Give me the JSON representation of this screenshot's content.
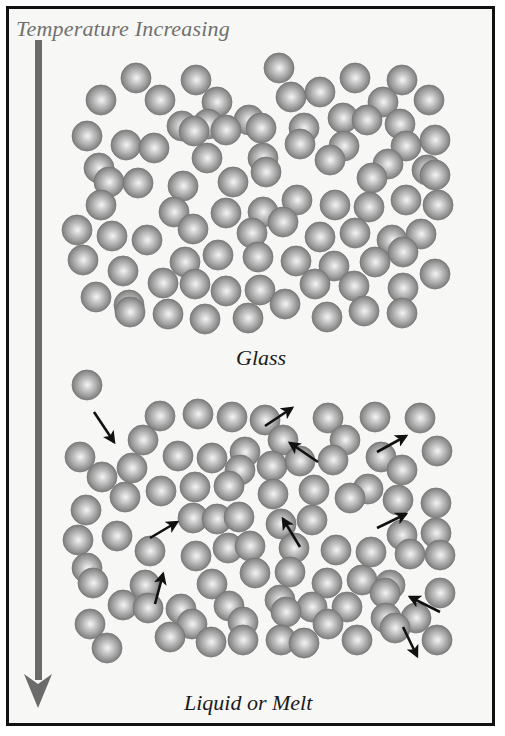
{
  "figure": {
    "title": "Temperature Increasing",
    "glass_label": "Glass",
    "liquid_label": "Liquid or Melt",
    "colors": {
      "background": "#f7f7f5",
      "border": "#111111",
      "title_text": "#707070",
      "label_text": "#1a1a1a",
      "temperature_arrow": "#6b6b6b",
      "sphere_light": "#f2f2f2",
      "sphere_mid": "#a8a8a8",
      "sphere_dark": "#6e6e6e",
      "motion_arrow": "#111111"
    },
    "temperature_arrow": {
      "x": 38,
      "y_start": 40,
      "y_end": 708,
      "direction": "down"
    },
    "sphere_radius": 15,
    "glass_spheres": [
      [
        279,
        68
      ],
      [
        136,
        78
      ],
      [
        196,
        80
      ],
      [
        355,
        78
      ],
      [
        402,
        80
      ],
      [
        101,
        100
      ],
      [
        160,
        100
      ],
      [
        217,
        102
      ],
      [
        291,
        97
      ],
      [
        320,
        92
      ],
      [
        383,
        102
      ],
      [
        429,
        100
      ],
      [
        208,
        124
      ],
      [
        249,
        120
      ],
      [
        182,
        126
      ],
      [
        343,
        118
      ],
      [
        400,
        124
      ],
      [
        87,
        136
      ],
      [
        126,
        145
      ],
      [
        194,
        131
      ],
      [
        226,
        130
      ],
      [
        261,
        128
      ],
      [
        304,
        128
      ],
      [
        367,
        120
      ],
      [
        406,
        146
      ],
      [
        435,
        140
      ],
      [
        99,
        168
      ],
      [
        154,
        148
      ],
      [
        207,
        158
      ],
      [
        263,
        158
      ],
      [
        300,
        144
      ],
      [
        344,
        146
      ],
      [
        388,
        164
      ],
      [
        427,
        170
      ],
      [
        109,
        182
      ],
      [
        138,
        183
      ],
      [
        183,
        186
      ],
      [
        233,
        182
      ],
      [
        266,
        172
      ],
      [
        330,
        160
      ],
      [
        372,
        178
      ],
      [
        435,
        175
      ],
      [
        101,
        205
      ],
      [
        174,
        212
      ],
      [
        226,
        213
      ],
      [
        263,
        212
      ],
      [
        297,
        200
      ],
      [
        335,
        205
      ],
      [
        369,
        207
      ],
      [
        406,
        200
      ],
      [
        438,
        205
      ],
      [
        77,
        230
      ],
      [
        112,
        236
      ],
      [
        147,
        240
      ],
      [
        193,
        229
      ],
      [
        252,
        233
      ],
      [
        283,
        222
      ],
      [
        320,
        237
      ],
      [
        355,
        233
      ],
      [
        392,
        240
      ],
      [
        421,
        234
      ],
      [
        83,
        260
      ],
      [
        123,
        271
      ],
      [
        185,
        262
      ],
      [
        218,
        255
      ],
      [
        258,
        257
      ],
      [
        296,
        261
      ],
      [
        334,
        266
      ],
      [
        375,
        262
      ],
      [
        403,
        252
      ],
      [
        96,
        297
      ],
      [
        129,
        305
      ],
      [
        163,
        283
      ],
      [
        195,
        284
      ],
      [
        226,
        291
      ],
      [
        260,
        290
      ],
      [
        315,
        284
      ],
      [
        354,
        286
      ],
      [
        403,
        288
      ],
      [
        435,
        274
      ],
      [
        130,
        312
      ],
      [
        168,
        314
      ],
      [
        205,
        319
      ],
      [
        248,
        318
      ],
      [
        285,
        304
      ],
      [
        327,
        317
      ],
      [
        364,
        311
      ],
      [
        402,
        313
      ]
    ],
    "liquid_spheres": [
      [
        87,
        385
      ],
      [
        160,
        416
      ],
      [
        198,
        414
      ],
      [
        232,
        417
      ],
      [
        265,
        420
      ],
      [
        328,
        418
      ],
      [
        375,
        417
      ],
      [
        420,
        418
      ],
      [
        80,
        457
      ],
      [
        143,
        440
      ],
      [
        178,
        456
      ],
      [
        212,
        458
      ],
      [
        245,
        452
      ],
      [
        283,
        440
      ],
      [
        345,
        440
      ],
      [
        381,
        457
      ],
      [
        437,
        451
      ],
      [
        102,
        477
      ],
      [
        132,
        468
      ],
      [
        161,
        491
      ],
      [
        195,
        487
      ],
      [
        240,
        470
      ],
      [
        272,
        466
      ],
      [
        300,
        461
      ],
      [
        333,
        460
      ],
      [
        368,
        489
      ],
      [
        402,
        470
      ],
      [
        86,
        510
      ],
      [
        125,
        497
      ],
      [
        229,
        486
      ],
      [
        273,
        494
      ],
      [
        314,
        490
      ],
      [
        350,
        498
      ],
      [
        398,
        500
      ],
      [
        436,
        503
      ],
      [
        78,
        540
      ],
      [
        117,
        536
      ],
      [
        193,
        518
      ],
      [
        217,
        519
      ],
      [
        239,
        517
      ],
      [
        281,
        524
      ],
      [
        312,
        520
      ],
      [
        402,
        535
      ],
      [
        436,
        533
      ],
      [
        87,
        568
      ],
      [
        150,
        551
      ],
      [
        196,
        556
      ],
      [
        228,
        548
      ],
      [
        250,
        546
      ],
      [
        294,
        548
      ],
      [
        336,
        550
      ],
      [
        371,
        552
      ],
      [
        410,
        554
      ],
      [
        440,
        555
      ],
      [
        93,
        583
      ],
      [
        145,
        585
      ],
      [
        212,
        584
      ],
      [
        255,
        573
      ],
      [
        290,
        572
      ],
      [
        327,
        583
      ],
      [
        362,
        580
      ],
      [
        390,
        585
      ],
      [
        123,
        605
      ],
      [
        181,
        609
      ],
      [
        229,
        606
      ],
      [
        280,
        600
      ],
      [
        312,
        607
      ],
      [
        347,
        607
      ],
      [
        385,
        593
      ],
      [
        440,
        593
      ],
      [
        90,
        624
      ],
      [
        148,
        608
      ],
      [
        192,
        624
      ],
      [
        243,
        622
      ],
      [
        286,
        612
      ],
      [
        328,
        624
      ],
      [
        386,
        618
      ],
      [
        416,
        618
      ],
      [
        107,
        648
      ],
      [
        170,
        637
      ],
      [
        211,
        642
      ],
      [
        243,
        640
      ],
      [
        281,
        640
      ],
      [
        304,
        643
      ],
      [
        357,
        640
      ],
      [
        395,
        628
      ],
      [
        437,
        640
      ]
    ],
    "motion_arrows": [
      [
        94,
        412,
        114,
        442
      ],
      [
        265,
        426,
        292,
        408
      ],
      [
        318,
        462,
        290,
        443
      ],
      [
        377,
        452,
        406,
        436
      ],
      [
        150,
        538,
        177,
        522
      ],
      [
        300,
        547,
        283,
        519
      ],
      [
        377,
        528,
        406,
        514
      ],
      [
        155,
        604,
        163,
        574
      ],
      [
        440,
        612,
        410,
        597
      ],
      [
        403,
        627,
        417,
        656
      ]
    ]
  }
}
